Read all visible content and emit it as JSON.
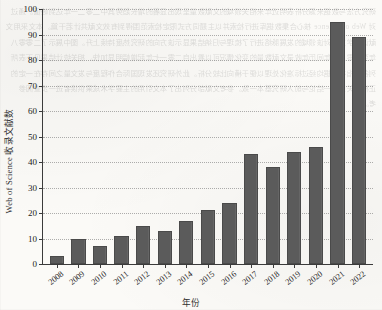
{
  "chart_data": {
    "type": "bar",
    "title": "",
    "xlabel": "年份",
    "ylabel": "Web of Science 收录文献数",
    "ylim": [
      0,
      100
    ],
    "yticks": [
      0,
      10,
      20,
      30,
      40,
      50,
      60,
      70,
      80,
      90,
      100
    ],
    "grid": true,
    "legend": "none",
    "bar_color": "#5b5b5b",
    "categories": [
      "2008",
      "2009",
      "2010",
      "2011",
      "2012",
      "2013",
      "2014",
      "2015",
      "2016",
      "2017",
      "2018",
      "2019",
      "2020",
      "2021",
      "2022"
    ],
    "values": [
      3,
      10,
      7,
      11,
      15,
      13,
      17,
      21,
      24,
      43,
      38,
      44,
      46,
      95,
      89
    ]
  },
  "background": {
    "ghost_text": "研究方法与数据来源分析表明近年来相关领域的文献数量呈现出显著的增长趋势其中二零二一年达到峰值。通过对 Web of Science 核心合集数据库进行检索并以主题词方式限定检索范围得到有效文献共计若干篇。本文采用文献计量学方法对该领域的发展脉络进行了梳理与归纳结果显示该方向的研究热度持续上升。图中展示了二零零八年至二零二二年间历年收录文献数量的变化情况可以看出自二零一七年起增幅明显加快。相关统计结果见下表所列各项指标数据均经过标准化处理以便于横向比较分析。此外研究还发现国际合作程度与发文量之间存在一定的正相关关系这一结论与前人研究基本一致。参考文献部分列出了本文引用的主要学术成果供读者进一步查阅参考。"
  }
}
